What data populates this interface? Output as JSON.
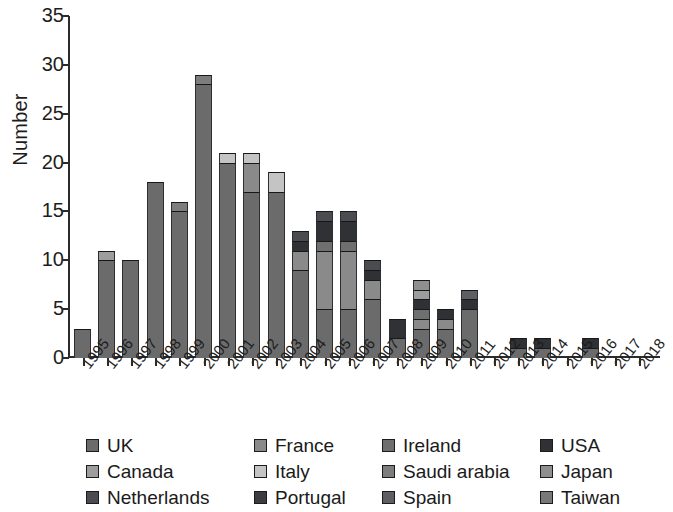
{
  "chart_data": {
    "type": "bar",
    "title": "",
    "subtitle": "",
    "xlabel": "",
    "ylabel": "Number",
    "ylim": [
      0,
      35
    ],
    "yticks": [
      0,
      5,
      10,
      15,
      20,
      25,
      30,
      35
    ],
    "grid": false,
    "stacked": true,
    "legend_position": "bottom",
    "legend_columns": 4,
    "categories": [
      "1995",
      "1996",
      "1997",
      "1998",
      "1999",
      "2000",
      "2001",
      "2002",
      "2003",
      "2004",
      "2005",
      "2006",
      "2007",
      "2008",
      "2009",
      "2010",
      "2011",
      "2012",
      "2013",
      "2014",
      "2015",
      "2016",
      "2017",
      "2018"
    ],
    "series": [
      {
        "name": "UK",
        "color": "#6b6b6b",
        "values": [
          3,
          10,
          10,
          18,
          15,
          28,
          20,
          17,
          17,
          9,
          5,
          5,
          6,
          2,
          3,
          3,
          5,
          0,
          1,
          1,
          0,
          1,
          0,
          0
        ]
      },
      {
        "name": "France",
        "color": "#8a8a8a",
        "values": [
          0,
          0,
          0,
          0,
          0,
          0,
          0,
          3,
          0,
          2,
          6,
          6,
          2,
          0,
          1,
          1,
          0,
          0,
          0,
          0,
          0,
          0,
          0,
          0
        ]
      },
      {
        "name": "Ireland",
        "color": "#6f6f6f",
        "values": [
          0,
          0,
          0,
          0,
          0,
          0,
          0,
          0,
          0,
          0,
          1,
          1,
          0,
          0,
          1,
          0,
          0,
          0,
          0,
          0,
          0,
          0,
          0,
          0
        ]
      },
      {
        "name": "USA",
        "color": "#2f3134",
        "values": [
          0,
          0,
          0,
          0,
          0,
          0,
          0,
          0,
          0,
          1,
          2,
          2,
          1,
          2,
          1,
          1,
          1,
          0,
          1,
          1,
          0,
          1,
          0,
          0
        ]
      },
      {
        "name": "Canada",
        "color": "#9d9d9d",
        "values": [
          0,
          1,
          0,
          0,
          0,
          0,
          0,
          0,
          0,
          0,
          0,
          0,
          0,
          0,
          1,
          0,
          0,
          0,
          0,
          0,
          0,
          0,
          0,
          0
        ]
      },
      {
        "name": "Italy",
        "color": "#c4c4c4",
        "values": [
          0,
          0,
          0,
          0,
          0,
          0,
          1,
          1,
          2,
          0,
          0,
          0,
          0,
          0,
          0,
          0,
          0,
          0,
          0,
          0,
          0,
          0,
          0,
          0
        ]
      },
      {
        "name": "Saudi arabia",
        "color": "#7d7d7d",
        "values": [
          0,
          0,
          0,
          0,
          1,
          1,
          0,
          0,
          0,
          0,
          0,
          0,
          0,
          0,
          0,
          0,
          0,
          0,
          0,
          0,
          0,
          0,
          0,
          0
        ]
      },
      {
        "name": "Japan",
        "color": "#8f8f8f",
        "values": [
          0,
          0,
          0,
          0,
          0,
          0,
          0,
          0,
          0,
          0,
          0,
          0,
          0,
          0,
          1,
          0,
          0,
          0,
          0,
          0,
          0,
          0,
          0,
          0
        ]
      },
      {
        "name": "Netherlands",
        "color": "#4a4c4f",
        "values": [
          0,
          0,
          0,
          0,
          0,
          0,
          0,
          0,
          0,
          1,
          1,
          1,
          1,
          0,
          0,
          0,
          0,
          0,
          0,
          0,
          0,
          0,
          0,
          0
        ]
      },
      {
        "name": "Portugal",
        "color": "#3a3c3f",
        "values": [
          0,
          0,
          0,
          0,
          0,
          0,
          0,
          0,
          0,
          0,
          0,
          0,
          0,
          0,
          0,
          0,
          0,
          0,
          0,
          0,
          0,
          0,
          0,
          0
        ]
      },
      {
        "name": "Spain",
        "color": "#5d5f62",
        "values": [
          0,
          0,
          0,
          0,
          0,
          0,
          0,
          0,
          0,
          0,
          0,
          0,
          0,
          0,
          0,
          0,
          1,
          0,
          0,
          0,
          0,
          0,
          0,
          0
        ]
      },
      {
        "name": "Taiwan",
        "color": "#787878",
        "values": [
          0,
          0,
          0,
          0,
          0,
          0,
          0,
          0,
          0,
          0,
          0,
          0,
          0,
          0,
          0,
          0,
          0,
          0,
          0,
          0,
          0,
          0,
          0,
          0
        ]
      }
    ],
    "totals": [
      3,
      11,
      10,
      18,
      16,
      29,
      21,
      21,
      19,
      13,
      15,
      15,
      10,
      4,
      8,
      5,
      7,
      0,
      2,
      2,
      0,
      2,
      0,
      0
    ]
  },
  "axis": {
    "ylabel": "Number",
    "ytick_labels": [
      "35",
      "30",
      "25",
      "20",
      "15",
      "10",
      "5",
      "0"
    ],
    "xtick_labels": [
      "1995",
      "1996",
      "1997",
      "1998",
      "1999",
      "2000",
      "2001",
      "2002",
      "2003",
      "2004",
      "2005",
      "2006",
      "2007",
      "2008",
      "2009",
      "2010",
      "2011",
      "2012",
      "2013",
      "2014",
      "2015",
      "2016",
      "2017",
      "2018"
    ]
  },
  "legend": {
    "entries": [
      {
        "label": "UK",
        "color": "#6b6b6b"
      },
      {
        "label": "France",
        "color": "#8a8a8a"
      },
      {
        "label": "Ireland",
        "color": "#6f6f6f"
      },
      {
        "label": "USA",
        "color": "#2f3134"
      },
      {
        "label": "Canada",
        "color": "#9d9d9d"
      },
      {
        "label": "Italy",
        "color": "#c4c4c4"
      },
      {
        "label": "Saudi arabia",
        "color": "#7d7d7d"
      },
      {
        "label": "Japan",
        "color": "#8f8f8f"
      },
      {
        "label": "Netherlands",
        "color": "#4a4c4f"
      },
      {
        "label": "Portugal",
        "color": "#3a3c3f"
      },
      {
        "label": "Spain",
        "color": "#5d5f62"
      },
      {
        "label": "Taiwan",
        "color": "#787878"
      }
    ]
  },
  "style": {
    "background": "#ffffff",
    "axis_color": "#2b2b2b",
    "text_color": "#1a1a1a"
  }
}
